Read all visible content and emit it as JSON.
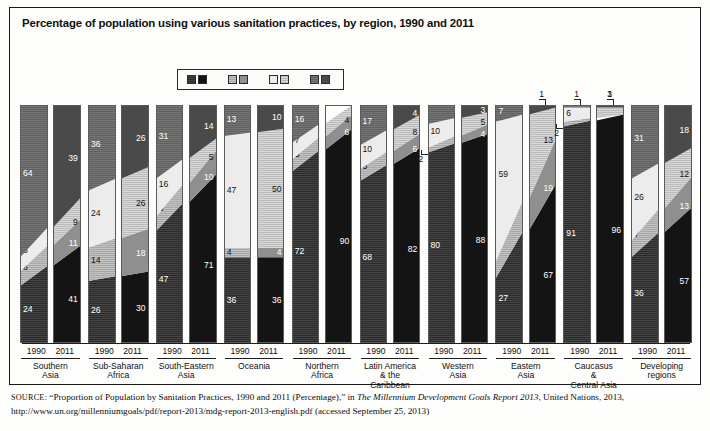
{
  "title": "Percentage of population using various sanitation practices, by region, 1990 and 2011",
  "legend": {
    "items": [
      {
        "label": "Improved",
        "swatch_1990": "#2b2b2b",
        "swatch_2011": "#141414"
      },
      {
        "label": "Shared",
        "swatch_1990": "#a8a8a8",
        "swatch_2011": "#8f8f8f"
      },
      {
        "label": "Unimproved",
        "swatch_1990": "#ececec",
        "swatch_2011": "#d8d8d8"
      },
      {
        "label": "Open defecation",
        "swatch_1990": "#606060",
        "swatch_2011": "#4a4a4a"
      }
    ]
  },
  "axis": {
    "years": [
      "1990",
      "2011"
    ]
  },
  "source": {
    "prefix": "SOURCE",
    "text_1": ": “Proportion of Population by Sanitation Practices, 1990 and 2011 (Percentage),” in ",
    "italic_1": "The Millennium Development Goals Report 2013",
    "text_2": ", United Nations, 2013, http://www.un.org/millenniumgoals/pdf/report-2013/mdg-report-2013-english.pdf (accessed September 25, 2013)"
  },
  "chart_data": {
    "type": "bar",
    "subtype": "100% stacked column, paired years per region",
    "title": "Percentage of population using various sanitation practices, by region, 1990 and 2011",
    "xlabel": "",
    "ylabel": "Percentage of population",
    "ylim": [
      0,
      100
    ],
    "grid": false,
    "legend_position": "top-center",
    "stack_order_bottom_to_top": [
      "Improved",
      "Shared",
      "Unimproved",
      "Open defecation"
    ],
    "series": [
      {
        "name": "Improved",
        "values_1990": [
          24,
          26,
          47,
          36,
          72,
          68,
          80,
          27,
          91,
          36
        ],
        "values_2011": [
          41,
          30,
          71,
          36,
          90,
          82,
          88,
          67,
          96,
          57
        ]
      },
      {
        "name": "Shared",
        "values_1990": [
          6,
          14,
          6,
          4,
          5,
          5,
          2,
          7,
          2,
          7
        ],
        "values_2011": [
          11,
          18,
          10,
          4,
          6,
          6,
          4,
          19,
          0,
          13
        ]
      },
      {
        "name": "Unimproved",
        "values_1990": [
          6,
          24,
          16,
          47,
          7,
          10,
          10,
          59,
          6,
          26
        ],
        "values_2011": [
          9,
          26,
          5,
          50,
          4,
          8,
          5,
          13,
          3,
          12
        ]
      },
      {
        "name": "Open defecation",
        "values_1990": [
          64,
          36,
          31,
          13,
          16,
          17,
          8,
          7,
          1,
          31
        ],
        "values_2011": [
          39,
          26,
          14,
          10,
          0,
          4,
          3,
          1,
          1,
          18
        ]
      }
    ],
    "regions": [
      {
        "name": "Southern Asia",
        "name_lines": [
          "Southern",
          "Asia"
        ],
        "bars": [
          {
            "year": "1990",
            "segments": [
              {
                "cat": "Improved",
                "value": 24,
                "label": "24"
              },
              {
                "cat": "Shared",
                "value": 6,
                "label": "6"
              },
              {
                "cat": "Unimproved",
                "value": 6,
                "label": "6"
              },
              {
                "cat": "Open defecation",
                "value": 64,
                "label": "64"
              }
            ]
          },
          {
            "year": "2011",
            "segments": [
              {
                "cat": "Improved",
                "value": 41,
                "label": "41"
              },
              {
                "cat": "Shared",
                "value": 11,
                "label": "11"
              },
              {
                "cat": "Unimproved",
                "value": 9,
                "label": "9"
              },
              {
                "cat": "Open defecation",
                "value": 39,
                "label": "39"
              }
            ]
          }
        ]
      },
      {
        "name": "Sub-Saharan Africa",
        "name_lines": [
          "Sub-Saharan",
          "Africa"
        ],
        "bars": [
          {
            "year": "1990",
            "segments": [
              {
                "cat": "Improved",
                "value": 26,
                "label": "26"
              },
              {
                "cat": "Shared",
                "value": 14,
                "label": "14"
              },
              {
                "cat": "Unimproved",
                "value": 24,
                "label": "24"
              },
              {
                "cat": "Open defecation",
                "value": 36,
                "label": "36"
              }
            ]
          },
          {
            "year": "2011",
            "segments": [
              {
                "cat": "Improved",
                "value": 30,
                "label": "30"
              },
              {
                "cat": "Shared",
                "value": 18,
                "label": "18"
              },
              {
                "cat": "Unimproved",
                "value": 26,
                "label": "26"
              },
              {
                "cat": "Open defecation",
                "value": 26,
                "label": "26"
              }
            ]
          }
        ]
      },
      {
        "name": "South-Eastern Asia",
        "name_lines": [
          "South-Eastern",
          "Asia"
        ],
        "bars": [
          {
            "year": "1990",
            "segments": [
              {
                "cat": "Improved",
                "value": 47,
                "label": "47"
              },
              {
                "cat": "Shared",
                "value": 6,
                "label": "6"
              },
              {
                "cat": "Unimproved",
                "value": 16,
                "label": "16"
              },
              {
                "cat": "Open defecation",
                "value": 31,
                "label": "31"
              }
            ]
          },
          {
            "year": "2011",
            "segments": [
              {
                "cat": "Improved",
                "value": 71,
                "label": "71"
              },
              {
                "cat": "Shared",
                "value": 10,
                "label": "10"
              },
              {
                "cat": "Unimproved",
                "value": 5,
                "label": "5"
              },
              {
                "cat": "Open defecation",
                "value": 14,
                "label": "14"
              }
            ]
          }
        ]
      },
      {
        "name": "Oceania",
        "name_lines": [
          "Oceania"
        ],
        "bars": [
          {
            "year": "1990",
            "segments": [
              {
                "cat": "Improved",
                "value": 36,
                "label": "36"
              },
              {
                "cat": "Shared",
                "value": 4,
                "label": "4"
              },
              {
                "cat": "Unimproved",
                "value": 47,
                "label": "47"
              },
              {
                "cat": "Open defecation",
                "value": 13,
                "label": "13"
              }
            ]
          },
          {
            "year": "2011",
            "segments": [
              {
                "cat": "Improved",
                "value": 36,
                "label": "36"
              },
              {
                "cat": "Shared",
                "value": 4,
                "label": "4"
              },
              {
                "cat": "Unimproved",
                "value": 50,
                "label": "50"
              },
              {
                "cat": "Open defecation",
                "value": 10,
                "label": "10"
              }
            ]
          }
        ]
      },
      {
        "name": "Northern Africa",
        "name_lines": [
          "Northern",
          "Africa"
        ],
        "bars": [
          {
            "year": "1990",
            "segments": [
              {
                "cat": "Improved",
                "value": 72,
                "label": "72"
              },
              {
                "cat": "Shared",
                "value": 5,
                "label": "5"
              },
              {
                "cat": "Unimproved",
                "value": 7,
                "label": "7"
              },
              {
                "cat": "Open defecation",
                "value": 16,
                "label": "16"
              }
            ]
          },
          {
            "year": "2011",
            "segments": [
              {
                "cat": "Improved",
                "value": 90,
                "label": "90"
              },
              {
                "cat": "Shared",
                "value": 6,
                "label": "6"
              },
              {
                "cat": "Unimproved",
                "value": 4,
                "label": "4"
              },
              {
                "cat": "Open defecation",
                "value": 0,
                "label": ""
              }
            ]
          }
        ]
      },
      {
        "name": "Latin America & the Caribbean",
        "name_lines": [
          "Latin America",
          "& the",
          "Caribbean"
        ],
        "bars": [
          {
            "year": "1990",
            "segments": [
              {
                "cat": "Improved",
                "value": 68,
                "label": "68"
              },
              {
                "cat": "Shared",
                "value": 5,
                "label": "5"
              },
              {
                "cat": "Unimproved",
                "value": 10,
                "label": "10"
              },
              {
                "cat": "Open defecation",
                "value": 17,
                "label": "17"
              }
            ]
          },
          {
            "year": "2011",
            "segments": [
              {
                "cat": "Improved",
                "value": 82,
                "label": "82"
              },
              {
                "cat": "Shared",
                "value": 6,
                "label": "6"
              },
              {
                "cat": "Unimproved",
                "value": 8,
                "label": "8"
              },
              {
                "cat": "Open defecation",
                "value": 4,
                "label": "4"
              }
            ]
          }
        ]
      },
      {
        "name": "Western Asia",
        "name_lines": [
          "Western",
          "Asia"
        ],
        "bars": [
          {
            "year": "1990",
            "segments": [
              {
                "cat": "Improved",
                "value": 80,
                "label": "80"
              },
              {
                "cat": "Shared",
                "value": 2,
                "label": "2",
                "callout": true
              },
              {
                "cat": "Unimproved",
                "value": 10,
                "label": "10"
              },
              {
                "cat": "Open defecation",
                "value": 8,
                "label": ""
              }
            ]
          },
          {
            "year": "2011",
            "segments": [
              {
                "cat": "Improved",
                "value": 88,
                "label": "88"
              },
              {
                "cat": "Shared",
                "value": 4,
                "label": "4"
              },
              {
                "cat": "Unimproved",
                "value": 5,
                "label": "5"
              },
              {
                "cat": "Open defecation",
                "value": 3,
                "label": "3"
              }
            ]
          }
        ]
      },
      {
        "name": "Eastern Asia",
        "name_lines": [
          "Eastern",
          "Asia"
        ],
        "bars": [
          {
            "year": "1990",
            "segments": [
              {
                "cat": "Improved",
                "value": 27,
                "label": "27"
              },
              {
                "cat": "Shared",
                "value": 7,
                "label": "7"
              },
              {
                "cat": "Unimproved",
                "value": 59,
                "label": "59"
              },
              {
                "cat": "Open defecation",
                "value": 7,
                "label": "7"
              }
            ]
          },
          {
            "year": "2011",
            "segments": [
              {
                "cat": "Improved",
                "value": 67,
                "label": "67"
              },
              {
                "cat": "Shared",
                "value": 19,
                "label": "19"
              },
              {
                "cat": "Unimproved",
                "value": 13,
                "label": "13"
              },
              {
                "cat": "Open defecation",
                "value": 1,
                "label": "1",
                "callout": true
              }
            ]
          }
        ]
      },
      {
        "name": "Caucasus & Central Asia",
        "name_lines": [
          "Caucasus",
          "&",
          "Central Asia"
        ],
        "bars": [
          {
            "year": "1990",
            "segments": [
              {
                "cat": "Improved",
                "value": 91,
                "label": "91"
              },
              {
                "cat": "Shared",
                "value": 2,
                "label": "2",
                "callout": true
              },
              {
                "cat": "Unimproved",
                "value": 6,
                "label": "6"
              },
              {
                "cat": "Open defecation",
                "value": 1,
                "label": "1",
                "callout": true
              }
            ]
          },
          {
            "year": "2011",
            "segments": [
              {
                "cat": "Improved",
                "value": 96,
                "label": "96"
              },
              {
                "cat": "Shared",
                "value": 0,
                "label": ""
              },
              {
                "cat": "Unimproved",
                "value": 3,
                "label": "3",
                "callout": true
              },
              {
                "cat": "Open defecation",
                "value": 1,
                "label": "1",
                "callout": true
              }
            ]
          }
        ]
      },
      {
        "name": "Developing regions",
        "name_lines": [
          "Developing",
          "regions"
        ],
        "bars": [
          {
            "year": "1990",
            "segments": [
              {
                "cat": "Improved",
                "value": 36,
                "label": "36"
              },
              {
                "cat": "Shared",
                "value": 7,
                "label": "7"
              },
              {
                "cat": "Unimproved",
                "value": 26,
                "label": "26"
              },
              {
                "cat": "Open defecation",
                "value": 31,
                "label": "31"
              }
            ]
          },
          {
            "year": "2011",
            "segments": [
              {
                "cat": "Improved",
                "value": 57,
                "label": "57"
              },
              {
                "cat": "Shared",
                "value": 13,
                "label": "13"
              },
              {
                "cat": "Unimproved",
                "value": 12,
                "label": "12"
              },
              {
                "cat": "Open defecation",
                "value": 18,
                "label": "18"
              }
            ]
          }
        ]
      }
    ]
  }
}
